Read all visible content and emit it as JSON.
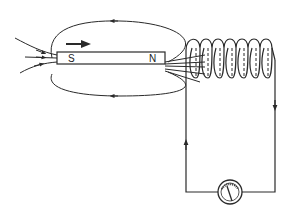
{
  "diagram": {
    "magnet": {
      "south_label": "S",
      "north_label": "N",
      "motion": "moving right toward coil"
    },
    "coil": {
      "turns": 8
    },
    "meter": {
      "type": "galvanometer"
    },
    "colors": {
      "line": "#2a2a2a",
      "background": "#ffffff"
    }
  }
}
